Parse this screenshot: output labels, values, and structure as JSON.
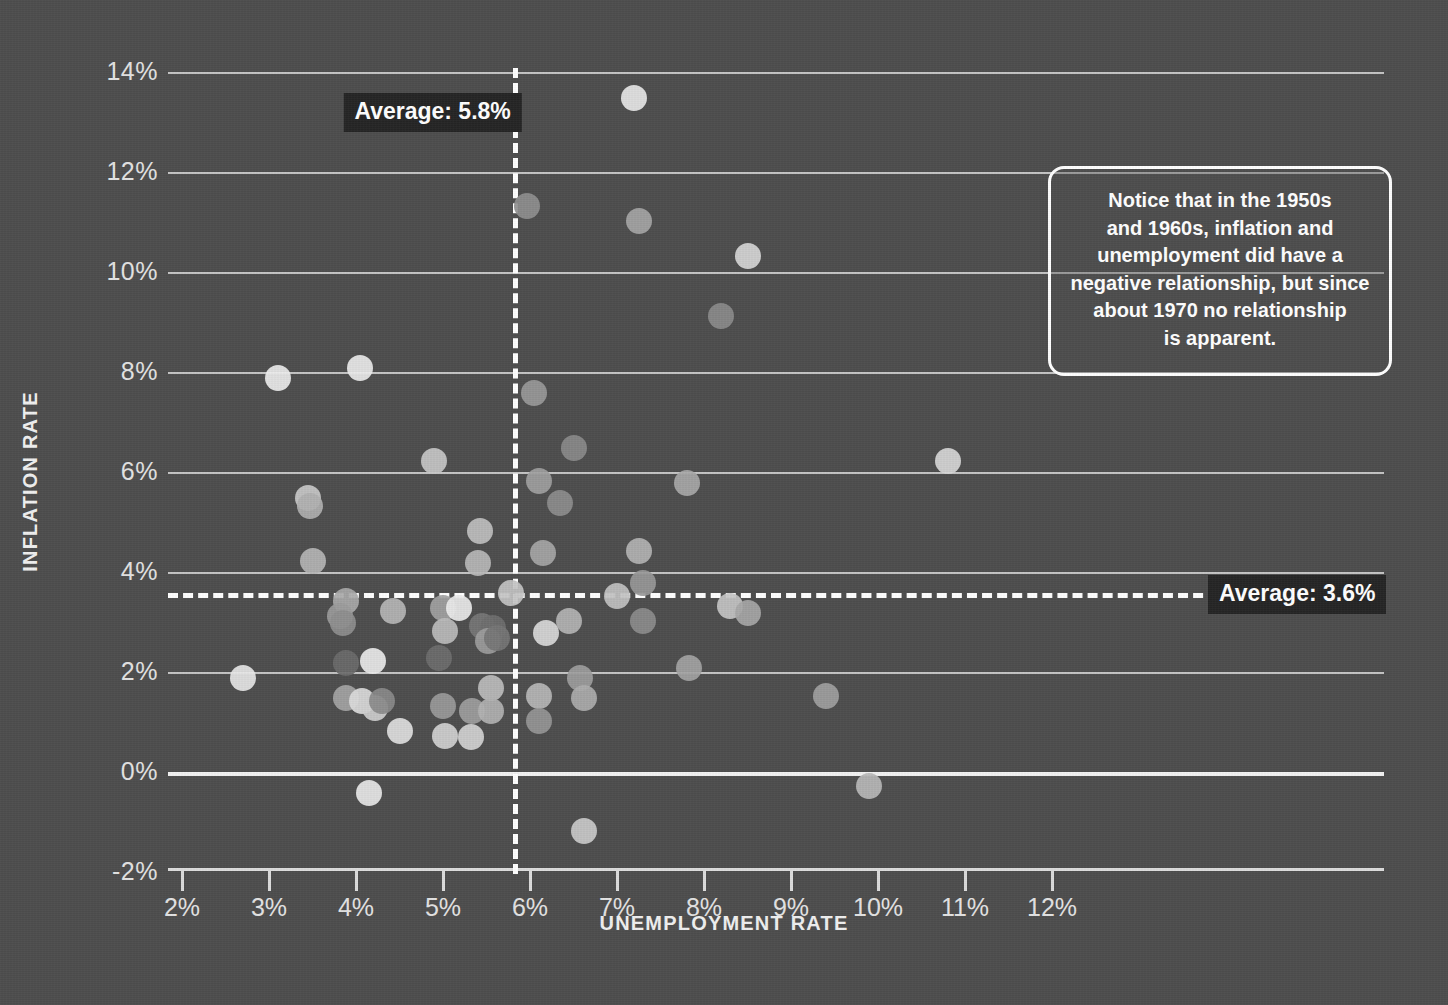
{
  "chart_data": {
    "type": "scatter",
    "title": "",
    "xlabel": "UNEMPLOYMENT RATE",
    "ylabel": "INFLATION RATE",
    "xlim": [
      1.5,
      12.5
    ],
    "ylim": [
      -2,
      14.6
    ],
    "grid": true,
    "legend": "none",
    "x_ticks": [
      "2%",
      "3%",
      "4%",
      "5%",
      "6%",
      "7%",
      "8%",
      "9%",
      "10%",
      "11%",
      "12%"
    ],
    "x_tick_values": [
      2,
      3,
      4,
      5,
      6,
      7,
      8,
      9,
      10,
      11,
      12
    ],
    "y_ticks": [
      "-2%",
      "0%",
      "2%",
      "4%",
      "6%",
      "8%",
      "10%",
      "12%",
      "14%"
    ],
    "y_tick_values": [
      -2,
      0,
      2,
      4,
      6,
      8,
      10,
      12,
      14
    ],
    "reference_lines": [
      {
        "orientation": "vertical",
        "value": 5.8,
        "label": "Average: 5.8%",
        "style": "dashed",
        "color": "#ffffff"
      },
      {
        "orientation": "horizontal",
        "value": 3.6,
        "label": "Average: 3.6%",
        "style": "dashed",
        "color": "#ffffff"
      }
    ],
    "annotations": [
      {
        "text": "Notice that in the 1950s and 1960s, inflation and unemployment did have a negative relationship, but since about 1970 no relationship is apparent.",
        "lines": [
          "Notice that in the 1950s",
          "and 1960s, inflation and",
          "unemployment did have a",
          "negative relationship, but since",
          "about 1970 no relationship",
          "is apparent."
        ]
      }
    ],
    "points": [
      {
        "x": 7.2,
        "y": 13.5,
        "shade": "#e8e8e8"
      },
      {
        "x": 5.97,
        "y": 11.35,
        "shade": "#8f8f8f"
      },
      {
        "x": 7.25,
        "y": 11.05,
        "shade": "#a5a5a5"
      },
      {
        "x": 8.5,
        "y": 10.35,
        "shade": "#d7d7d7"
      },
      {
        "x": 8.2,
        "y": 9.15,
        "shade": "#8b8b8b"
      },
      {
        "x": 3.1,
        "y": 7.9,
        "shade": "#ededed"
      },
      {
        "x": 4.05,
        "y": 8.1,
        "shade": "#ececec"
      },
      {
        "x": 6.05,
        "y": 7.6,
        "shade": "#999999"
      },
      {
        "x": 6.5,
        "y": 6.5,
        "shade": "#8a8a8a"
      },
      {
        "x": 10.8,
        "y": 6.25,
        "shade": "#d8d8d8"
      },
      {
        "x": 4.9,
        "y": 6.25,
        "shade": "#c8c8c8"
      },
      {
        "x": 6.1,
        "y": 5.85,
        "shade": "#9f9f9f"
      },
      {
        "x": 6.35,
        "y": 5.4,
        "shade": "#8d8d8d"
      },
      {
        "x": 7.8,
        "y": 5.8,
        "shade": "#a8a8a8"
      },
      {
        "x": 3.45,
        "y": 5.5,
        "shade": "#c9c9c9"
      },
      {
        "x": 3.47,
        "y": 5.35,
        "shade": "#b0b0b0"
      },
      {
        "x": 3.5,
        "y": 4.25,
        "shade": "#b5b5b5"
      },
      {
        "x": 5.42,
        "y": 4.85,
        "shade": "#c0c0c0"
      },
      {
        "x": 5.4,
        "y": 4.2,
        "shade": "#b8b8b8"
      },
      {
        "x": 6.15,
        "y": 4.4,
        "shade": "#a6a6a6"
      },
      {
        "x": 7.25,
        "y": 4.45,
        "shade": "#b3b3b3"
      },
      {
        "x": 7.3,
        "y": 3.8,
        "shade": "#989898"
      },
      {
        "x": 7.0,
        "y": 3.55,
        "shade": "#c2c2c2"
      },
      {
        "x": 5.78,
        "y": 3.6,
        "shade": "#c4c4c4"
      },
      {
        "x": 3.88,
        "y": 3.45,
        "shade": "#a9a9a9"
      },
      {
        "x": 3.82,
        "y": 3.15,
        "shade": "#9b9b9b"
      },
      {
        "x": 3.85,
        "y": 3.0,
        "shade": "#8e8e8e"
      },
      {
        "x": 4.42,
        "y": 3.25,
        "shade": "#b6b6b6"
      },
      {
        "x": 5.0,
        "y": 3.3,
        "shade": "#a2a2a2"
      },
      {
        "x": 5.18,
        "y": 3.3,
        "shade": "#ececec"
      },
      {
        "x": 5.02,
        "y": 2.85,
        "shade": "#bcbcbc"
      },
      {
        "x": 5.45,
        "y": 2.95,
        "shade": "#767676"
      },
      {
        "x": 5.57,
        "y": 2.9,
        "shade": "#6e6e6e"
      },
      {
        "x": 5.52,
        "y": 2.65,
        "shade": "#9c9c9c"
      },
      {
        "x": 5.62,
        "y": 2.7,
        "shade": "#757575"
      },
      {
        "x": 6.45,
        "y": 3.05,
        "shade": "#b4b4b4"
      },
      {
        "x": 7.3,
        "y": 3.05,
        "shade": "#8c8c8c"
      },
      {
        "x": 8.3,
        "y": 3.35,
        "shade": "#c6c6c6"
      },
      {
        "x": 8.5,
        "y": 3.2,
        "shade": "#a7a7a7"
      },
      {
        "x": 6.18,
        "y": 2.8,
        "shade": "#dadada"
      },
      {
        "x": 3.88,
        "y": 2.2,
        "shade": "#6a6a6a"
      },
      {
        "x": 4.2,
        "y": 2.25,
        "shade": "#ebebeb"
      },
      {
        "x": 4.95,
        "y": 2.3,
        "shade": "#6d6d6d"
      },
      {
        "x": 2.7,
        "y": 1.9,
        "shade": "#e7e7e7"
      },
      {
        "x": 7.83,
        "y": 2.1,
        "shade": "#a3a3a3"
      },
      {
        "x": 6.58,
        "y": 1.9,
        "shade": "#9d9d9d"
      },
      {
        "x": 6.62,
        "y": 1.5,
        "shade": "#adadad"
      },
      {
        "x": 9.4,
        "y": 1.55,
        "shade": "#a0a0a0"
      },
      {
        "x": 3.88,
        "y": 1.5,
        "shade": "#a4a4a4"
      },
      {
        "x": 4.07,
        "y": 1.45,
        "shade": "#dcdcdc"
      },
      {
        "x": 4.22,
        "y": 1.3,
        "shade": "#cfcfcf"
      },
      {
        "x": 4.3,
        "y": 1.45,
        "shade": "#8a8a8a"
      },
      {
        "x": 4.5,
        "y": 0.85,
        "shade": "#e1e1e1"
      },
      {
        "x": 5.0,
        "y": 1.35,
        "shade": "#9a9a9a"
      },
      {
        "x": 5.02,
        "y": 0.75,
        "shade": "#d2d2d2"
      },
      {
        "x": 5.33,
        "y": 1.25,
        "shade": "#9e9e9e"
      },
      {
        "x": 5.32,
        "y": 0.72,
        "shade": "#d4d4d4"
      },
      {
        "x": 5.55,
        "y": 1.7,
        "shade": "#bdbdbd"
      },
      {
        "x": 5.55,
        "y": 1.25,
        "shade": "#b2b2b2"
      },
      {
        "x": 6.1,
        "y": 1.55,
        "shade": "#b7b7b7"
      },
      {
        "x": 6.1,
        "y": 1.05,
        "shade": "#9696 96"
      },
      {
        "x": 4.15,
        "y": -0.4,
        "shade": "#e9e9e9"
      },
      {
        "x": 9.9,
        "y": -0.25,
        "shade": "#b9b9b9"
      },
      {
        "x": 6.62,
        "y": -1.15,
        "shade": "#cbcbcb"
      }
    ]
  },
  "axes": {
    "y_title": "INFLATION RATE",
    "x_title": "UNEMPLOYMENT RATE"
  }
}
